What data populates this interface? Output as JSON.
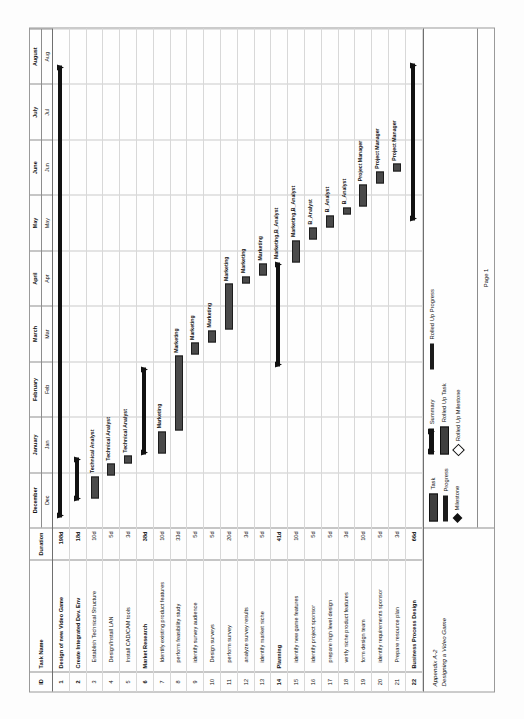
{
  "table": {
    "columns": [
      "ID",
      "Task Name",
      "Duration"
    ]
  },
  "timeline": {
    "months": [
      "December",
      "January",
      "February",
      "March",
      "April",
      "May",
      "June",
      "July",
      "August"
    ],
    "abbr": [
      "Dec",
      "Jan",
      "Feb",
      "Mar",
      "Apr",
      "May",
      "Jun",
      "Jul",
      "Aug"
    ]
  },
  "footer": {
    "caption_line1": "Appendix A-2",
    "caption_line2": "Designing a Video Game",
    "page": "Page 1"
  },
  "legend": {
    "items": [
      {
        "label": "Task"
      },
      {
        "label": "Progress"
      },
      {
        "label": "Milestone"
      },
      {
        "label": "Summary"
      },
      {
        "label": "Rolled Up Task"
      },
      {
        "label": "Rolled Up Milestone"
      },
      {
        "label": "Rolled Up Progress"
      }
    ]
  },
  "chart_data": {
    "type": "bar",
    "title": "Designing a Video Game",
    "xlabel": "",
    "ylabel": "",
    "axis_months": [
      "Dec",
      "Jan",
      "Feb",
      "Mar",
      "Apr",
      "May",
      "Jun",
      "Jul",
      "Aug"
    ],
    "categories": [
      "Design of new Video Game",
      "Create Integrated Dev. Env",
      "Establish Technical Structure",
      "Design/Install LAN",
      "Install CAD/CAM tools",
      "Market Research",
      "Identify existing product features",
      "perform feasibility study",
      "identify survey audience",
      "Design surveys",
      "perform survey",
      "analyze survey results",
      "identify market niche",
      "Planning",
      "identify new game features",
      "identify project sponsor",
      "prepare high level design",
      "verify niche product features",
      "form design team",
      "identify requirements sponsor",
      "Prepare resource plan",
      "Business Process Design"
    ],
    "values": [
      198,
      18,
      10,
      5,
      3,
      38,
      10,
      33,
      5,
      5,
      20,
      3,
      5,
      41,
      10,
      5,
      5,
      3,
      10,
      5,
      3,
      66
    ],
    "rows": [
      {
        "id": "1",
        "name": "Design of new Video Game",
        "duration": "198d",
        "summary": true,
        "start": 0.02,
        "len": 0.905,
        "resource": ""
      },
      {
        "id": "2",
        "name": "Create Integrated Dev. Env",
        "duration": "18d",
        "summary": true,
        "start": 0.055,
        "len": 0.085,
        "resource": ""
      },
      {
        "id": "3",
        "name": "Establish Technical Structure",
        "duration": "10d",
        "summary": false,
        "start": 0.058,
        "len": 0.045,
        "resource": "Technical Analyst"
      },
      {
        "id": "4",
        "name": "Design/Install LAN",
        "duration": "5d",
        "summary": false,
        "start": 0.104,
        "len": 0.024,
        "resource": "Technical Analyst"
      },
      {
        "id": "5",
        "name": "Install CAD/CAM tools",
        "duration": "3d",
        "summary": false,
        "start": 0.129,
        "len": 0.015,
        "resource": "Technical Analyst"
      },
      {
        "id": "6",
        "name": "Market Research",
        "duration": "38d",
        "summary": true,
        "start": 0.146,
        "len": 0.175,
        "resource": ""
      },
      {
        "id": "7",
        "name": "Identify existing product features",
        "duration": "10d",
        "summary": false,
        "start": 0.148,
        "len": 0.045,
        "resource": "Marketing"
      },
      {
        "id": "8",
        "name": "perform feasibility study",
        "duration": "33d",
        "summary": false,
        "start": 0.194,
        "len": 0.15,
        "resource": "Marketing"
      },
      {
        "id": "9",
        "name": "identify survey audience",
        "duration": "5d",
        "summary": false,
        "start": 0.346,
        "len": 0.024,
        "resource": "Marketing"
      },
      {
        "id": "10",
        "name": "Design surveys",
        "duration": "5d",
        "summary": false,
        "start": 0.371,
        "len": 0.024,
        "resource": "Marketing"
      },
      {
        "id": "11",
        "name": "perform survey",
        "duration": "20d",
        "summary": false,
        "start": 0.396,
        "len": 0.092,
        "resource": "Marketing"
      },
      {
        "id": "12",
        "name": "analyze survey results",
        "duration": "3d",
        "summary": false,
        "start": 0.489,
        "len": 0.015,
        "resource": "Marketing"
      },
      {
        "id": "13",
        "name": "identify market niche",
        "duration": "5d",
        "summary": false,
        "start": 0.505,
        "len": 0.024,
        "resource": "Marketing"
      },
      {
        "id": "14",
        "name": "Planning",
        "duration": "41d",
        "summary": true,
        "start": 0.322,
        "len": 0.21,
        "resource": "Marketing,B_Analyst"
      },
      {
        "id": "15",
        "name": "identify new game features",
        "duration": "10d",
        "summary": false,
        "start": 0.531,
        "len": 0.045,
        "resource": "Marketing,B_Analyst"
      },
      {
        "id": "16",
        "name": "identify project sponsor",
        "duration": "5d",
        "summary": false,
        "start": 0.577,
        "len": 0.024,
        "resource": "B_Analyst"
      },
      {
        "id": "17",
        "name": "prepare high level design",
        "duration": "5d",
        "summary": false,
        "start": 0.602,
        "len": 0.024,
        "resource": "B_Analyst"
      },
      {
        "id": "18",
        "name": "verify niche product features",
        "duration": "3d",
        "summary": false,
        "start": 0.627,
        "len": 0.015,
        "resource": "B_Analyst"
      },
      {
        "id": "19",
        "name": "form design team",
        "duration": "10d",
        "summary": false,
        "start": 0.643,
        "len": 0.045,
        "resource": "Project Manager"
      },
      {
        "id": "20",
        "name": "identify requirements sponsor",
        "duration": "5d",
        "summary": false,
        "start": 0.689,
        "len": 0.024,
        "resource": "Project Manager"
      },
      {
        "id": "21",
        "name": "Prepare resource plan",
        "duration": "3d",
        "summary": false,
        "start": 0.714,
        "len": 0.015,
        "resource": "Project Manager"
      },
      {
        "id": "22",
        "name": "Business Process Design",
        "duration": "66d",
        "summary": true,
        "start": 0.615,
        "len": 0.315,
        "resource": ""
      }
    ]
  }
}
